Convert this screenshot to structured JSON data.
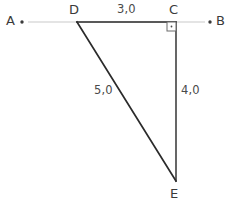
{
  "figure": {
    "background_color": "#ffffff",
    "line_color_primary": "#2b2b2b",
    "line_color_secondary": "#c9c9c9",
    "label_color": "#3a3a3a",
    "width": 235,
    "height": 205
  },
  "vertices": {
    "A": {
      "label": "A",
      "x": 22,
      "y": 22,
      "has_dot": true
    },
    "B": {
      "label": "B",
      "x": 210,
      "y": 22,
      "has_dot": true
    },
    "C": {
      "label": "C",
      "x": 176,
      "y": 22,
      "has_dot": false
    },
    "D": {
      "label": "D",
      "x": 77,
      "y": 22,
      "has_dot": false
    },
    "E": {
      "label": "E",
      "x": 176,
      "y": 181,
      "has_dot": false
    }
  },
  "segments": {
    "AB": {
      "name": "line-ab",
      "from": "A",
      "to": "B",
      "style": "light"
    },
    "DC": {
      "name": "segment-dc",
      "from": "D",
      "to": "C",
      "style": "bold"
    },
    "DE": {
      "name": "segment-de",
      "from": "D",
      "to": "E",
      "style": "bold"
    },
    "CE": {
      "name": "segment-ce",
      "from": "C",
      "to": "E",
      "style": "bold"
    }
  },
  "measures": {
    "dc": "3,0",
    "de": "5,0",
    "ce": "4,0"
  },
  "markers": {
    "right_angle": {
      "name": "right-angle-marker",
      "at_vertex": "C",
      "size": 9,
      "has_center_dot": true
    }
  }
}
